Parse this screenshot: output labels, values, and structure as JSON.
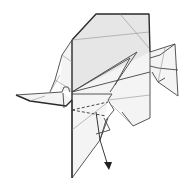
{
  "diagram": {
    "title": "",
    "style": "black line art on white",
    "colors": {
      "background": "#ffffff",
      "line": "#2a2a2a",
      "paper": "#f4f4f4",
      "shade": "#e6e6e6"
    },
    "symbols": [
      "valley-fold-dashed-line",
      "fold-direction-arrow"
    ]
  }
}
